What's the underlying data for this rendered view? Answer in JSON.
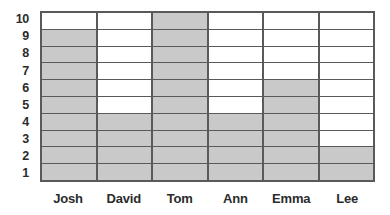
{
  "chart_data": {
    "type": "bar",
    "title": "",
    "xlabel": "",
    "ylabel": "",
    "categories": [
      "Josh",
      "David",
      "Tom",
      "Ann",
      "Emma",
      "Lee"
    ],
    "values": [
      9,
      4,
      10,
      4,
      6,
      2
    ],
    "ylim": [
      0,
      10
    ],
    "ytick_labels": [
      "10",
      "9",
      "8",
      "7",
      "6",
      "5",
      "4",
      "3",
      "2",
      "1"
    ],
    "ytick_values": [
      10,
      9,
      8,
      7,
      6,
      5,
      4,
      3,
      2,
      1
    ],
    "grid": true,
    "legend": false,
    "orientation": "vertical",
    "colors": {
      "bar_fill": "#c9c9c9",
      "grid_line": "#595959",
      "axis_border": "#595959",
      "label_text": "#2b2b2b",
      "background": "#ffffff"
    }
  }
}
